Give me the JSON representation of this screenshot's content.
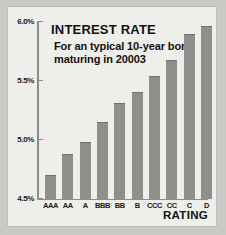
{
  "chart_data": {
    "type": "bar",
    "title": "INTEREST RATE",
    "subtitle": "For an typical 10-year bond maturing in 20003",
    "xlabel": "RATING",
    "ylabel": "",
    "categories": [
      "AAA",
      "AA",
      "A",
      "BBB",
      "BB",
      "B",
      "CCC",
      "CC",
      "C",
      "D"
    ],
    "values": [
      4.7,
      4.88,
      4.98,
      5.15,
      5.31,
      5.41,
      5.54,
      5.68,
      5.9,
      5.97
    ],
    "ylim": [
      4.5,
      6.0
    ],
    "yticks": [
      4.5,
      5.0,
      5.5,
      6.0
    ],
    "ytick_labels": [
      "4.5%",
      "5.0%",
      "5.5%",
      "6.0%"
    ],
    "grid": false,
    "legend": null,
    "colors": {
      "bar": "#8f8f8b",
      "plot_background": "#eeeeea",
      "page_background": "#c9c9c5",
      "axis": "#8d8d89",
      "text": "#111111"
    }
  }
}
